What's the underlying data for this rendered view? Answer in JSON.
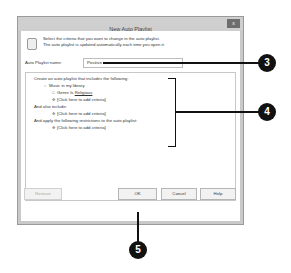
{
  "dialog": {
    "title": "New Auto Playlist",
    "close_label": "x",
    "header_line1": "Select the criteria that you want to change in the auto playlist.",
    "header_line2": "The auto playlist is updated automatically each time you open it.",
    "name_label": "Auto Playlist name:",
    "name_value": "Positive",
    "criteria": {
      "section1_heading": "Create an auto playlist that includes the following:",
      "source": "Music in my library",
      "rule_field": "Genre",
      "rule_operator": "Is",
      "rule_value": "Religious",
      "add_criteria_1": "[Click here to add criteria]",
      "section2_heading": "And also include:",
      "add_criteria_2": "[Click here to add criteria]",
      "section3_heading": "And apply the following restrictions to the auto playlist:",
      "add_criteria_3": "[Click here to add criteria]"
    },
    "buttons": {
      "remove": "Remove",
      "ok": "OK",
      "cancel": "Cancel",
      "help": "Help"
    }
  },
  "callouts": {
    "name_field": "3",
    "criteria_box": "4",
    "ok_button": "5"
  }
}
